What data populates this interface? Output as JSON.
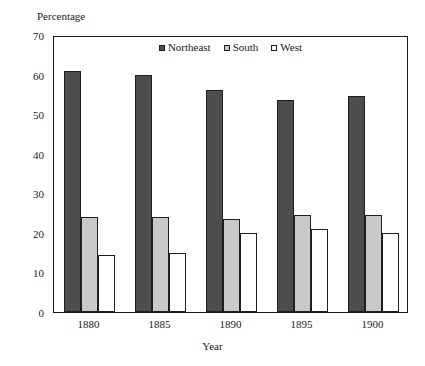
{
  "chart_data": {
    "type": "bar",
    "title": "",
    "subtitle": "",
    "ylabel": "Percentage",
    "xlabel": "Year",
    "categories": [
      "1880",
      "1885",
      "1890",
      "1895",
      "1900"
    ],
    "series": [
      {
        "name": "Northeast",
        "color": "#4d4d4d",
        "values": [
          61,
          60,
          56,
          53.5,
          54.5
        ]
      },
      {
        "name": "South",
        "color": "#c9c9c9",
        "values": [
          24,
          24,
          23.5,
          24.5,
          24.5
        ]
      },
      {
        "name": "West",
        "color": "#ffffff",
        "values": [
          14.5,
          15,
          20,
          21,
          20
        ]
      }
    ],
    "ylim": [
      0,
      70
    ],
    "ytick_values": [
      0,
      10,
      20,
      30,
      40,
      50,
      60,
      70
    ],
    "ytick_labels": [
      "0",
      "10",
      "20",
      "30",
      "40",
      "50",
      "60",
      "70"
    ],
    "grid": false,
    "legend_position": "top-center",
    "legend_entries": [
      "Northeast",
      "South",
      "West"
    ],
    "frame": true
  }
}
